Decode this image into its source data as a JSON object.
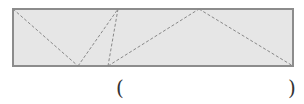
{
  "diagram": {
    "rectangle": {
      "x": 13,
      "y": 9,
      "width": 280,
      "height": 57,
      "fill": "#e6e6e6",
      "stroke": "#8c8c8c"
    },
    "dashed_lines": [
      {
        "x1": 13,
        "y1": 9,
        "x2": 78,
        "y2": 66
      },
      {
        "x1": 78,
        "y1": 66,
        "x2": 118,
        "y2": 9
      },
      {
        "x1": 118,
        "y1": 9,
        "x2": 108,
        "y2": 66
      },
      {
        "x1": 108,
        "y1": 66,
        "x2": 199,
        "y2": 9
      },
      {
        "x1": 199,
        "y1": 9,
        "x2": 293,
        "y2": 66
      }
    ],
    "dash_color": "#888888"
  },
  "answer_blank": {
    "open": "(",
    "close": ")"
  }
}
